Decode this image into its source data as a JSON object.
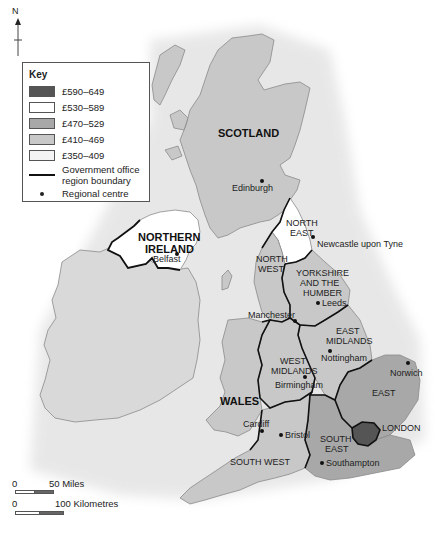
{
  "compass": {
    "label": "N"
  },
  "key": {
    "title": "Key",
    "items": [
      {
        "label": "£590–649",
        "color": "#555555"
      },
      {
        "label": "£530–589",
        "color": "#ffffff"
      },
      {
        "label": "£470–529",
        "color": "#a8a8a8"
      },
      {
        "label": "£410–469",
        "color": "#c8c8c8"
      },
      {
        "label": "£350–409",
        "color": "#f4f4f4"
      }
    ],
    "boundary_label": "Government office region boundary",
    "boundary_label_line1": "Government office",
    "boundary_label_line2": "region boundary",
    "centre_label": "Regional centre"
  },
  "regions": [
    {
      "name": "SCOTLAND",
      "band": "£410–469"
    },
    {
      "name": "NORTHERN IRELAND",
      "band": "£530–589"
    },
    {
      "name": "NORTH EAST",
      "band": "£350–409"
    },
    {
      "name": "NORTH WEST",
      "band": "£410–469"
    },
    {
      "name": "YORKSHIRE AND THE HUMBER",
      "band": "£410–469"
    },
    {
      "name": "EAST MIDLANDS",
      "band": "£410–469"
    },
    {
      "name": "WEST MIDLANDS",
      "band": "£410–469"
    },
    {
      "name": "WALES",
      "band": "£410–469"
    },
    {
      "name": "EAST",
      "band": "£470–529"
    },
    {
      "name": "LONDON",
      "band": "£590–649"
    },
    {
      "name": "SOUTH EAST",
      "band": "£470–529"
    },
    {
      "name": "SOUTH WEST",
      "band": "£410–469"
    }
  ],
  "labels": {
    "scotland": "SCOTLAND",
    "ni_1": "NORTHERN",
    "ni_2": "IRELAND",
    "ne_1": "NORTH",
    "ne_2": "EAST",
    "nw_1": "NORTH",
    "nw_2": "WEST",
    "yh_1": "YORKSHIRE",
    "yh_2": "AND THE",
    "yh_3": "HUMBER",
    "em_1": "EAST",
    "em_2": "MIDLANDS",
    "wm_1": "WEST",
    "wm_2": "MIDLANDS",
    "wales": "WALES",
    "east": "EAST",
    "london": "LONDON",
    "se_1": "SOUTH",
    "se_2": "EAST",
    "sw": "SOUTH WEST"
  },
  "cities": {
    "edinburgh": "Edinburgh",
    "newcastle": "Newcastle upon Tyne",
    "belfast": "Belfast",
    "leeds": "Leeds",
    "manchester": "Manchester",
    "nottingham": "Nottingham",
    "birmingham": "Birmingham",
    "norwich": "Norwich",
    "cardiff": "Cardiff",
    "bristol": "Bristol",
    "southampton": "Southampton"
  },
  "scale": {
    "miles_zero": "0",
    "miles_label": "50 Miles",
    "km_zero": "0",
    "km_label": "100 Kilometres"
  }
}
